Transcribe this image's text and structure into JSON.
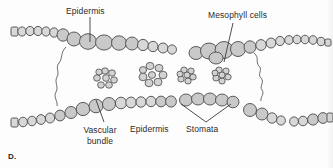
{
  "figure": {
    "letter": "D."
  },
  "labels": {
    "epidermis_top": "Epidermis",
    "mesophyll": "Mesophyll cells",
    "vascular_bundle": "Vascular bundle",
    "epidermis_bottom": "Epidermis",
    "stomata": "Stomata"
  },
  "colors": {
    "cell_fill": "#c9c9c9",
    "cell_fill_light": "#d8d8d8",
    "cell_outline": "#4a4a4a",
    "small_cell_fill": "#d2d2d2",
    "text": "#2b2b2b",
    "background": "#fdfdfd",
    "leader_line": "#3a3a3a"
  },
  "structures": {
    "epidermis_top_left": "chain-of-cells-upper-left",
    "epidermis_top_right": "chain-of-cells-upper-right",
    "epidermis_bottom_left": "chain-of-cells-lower-left",
    "epidermis_bottom_right": "chain-of-cells-lower-right",
    "stomata_group": "cell-cluster-lower-middle",
    "vascular_bundles": [
      "rosette-left",
      "rosette-center",
      "rosette-right-small",
      "rosette-far-right-small"
    ],
    "mesophyll_cells": "large-rounded-cells",
    "wavy_connectors": [
      "wavy-line-left",
      "wavy-line-right"
    ]
  }
}
